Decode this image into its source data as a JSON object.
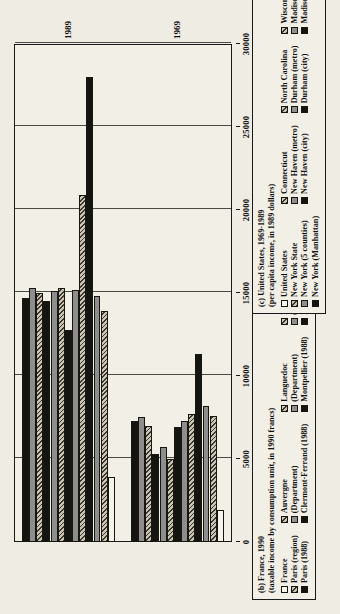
{
  "figure": {
    "axis": {
      "ticks": [
        "0",
        "5000",
        "10000",
        "15000",
        "20000",
        "25000",
        "30000"
      ],
      "tick_values": [
        0,
        5000,
        10000,
        15000,
        20000,
        25000,
        30000
      ],
      "max": 30000,
      "group_labels": [
        "1969",
        "1989"
      ]
    },
    "legend_b": {
      "title_line1": "(b) France, 1990",
      "title_line2": "(taxable income by consumption unit, in 1990 francs)",
      "columns": [
        {
          "header": "",
          "entries": [
            {
              "label": "France",
              "pattern": "white"
            },
            {
              "label": "Paris (region)",
              "pattern": "hatch"
            },
            {
              "label": "Paris (1988)",
              "pattern": "black"
            }
          ]
        },
        {
          "header": "Auvergne",
          "entries": [
            {
              "label": "Auvergne",
              "pattern": "hatch"
            },
            {
              "label": "(Department)",
              "pattern": "gray"
            },
            {
              "label": "Clermont-Ferrand (1988)",
              "pattern": "black"
            }
          ]
        },
        {
          "header": "Languedoc",
          "entries": [
            {
              "label": "Languedoc",
              "pattern": "hatch"
            },
            {
              "label": "(Department)",
              "pattern": "gray"
            },
            {
              "label": "Montpellier (1988)",
              "pattern": "black"
            }
          ]
        },
        {
          "header": "Lorraine",
          "entries": [
            {
              "label": "Lorraine",
              "pattern": "hatch"
            },
            {
              "label": "(Department)",
              "pattern": "gray"
            },
            {
              "label": "Nancy (1988)",
              "pattern": "black"
            }
          ]
        },
        {
          "header": "Brittany",
          "entries": [
            {
              "label": "Brittany",
              "pattern": "hatch"
            },
            {
              "label": "(Department)",
              "pattern": "gray"
            },
            {
              "label": "Rennes (1988)",
              "pattern": "black"
            }
          ]
        }
      ]
    },
    "legend_c": {
      "title_line1": "(c) United States, 1969-1989",
      "title_line2": "(per capita income, in 1989 dollars)",
      "columns": [
        {
          "entries": [
            {
              "label": "United States",
              "pattern": "white"
            },
            {
              "label": "New York State",
              "pattern": "hatch"
            },
            {
              "label": "New York (5 counties)",
              "pattern": "gray"
            },
            {
              "label": "New York (Manhattan)",
              "pattern": "black"
            }
          ]
        },
        {
          "entries": [
            {
              "label": "Connecticut",
              "pattern": "hatch"
            },
            {
              "label": "New Haven (metro)",
              "pattern": "gray"
            },
            {
              "label": "New Haven (city)",
              "pattern": "black"
            }
          ]
        },
        {
          "entries": [
            {
              "label": "North Carolina",
              "pattern": "hatch"
            },
            {
              "label": "Durham (metro)",
              "pattern": "gray"
            },
            {
              "label": "Durham (city)",
              "pattern": "black"
            }
          ]
        },
        {
          "entries": [
            {
              "label": "Wisconsin",
              "pattern": "hatch"
            },
            {
              "label": "Madison (metro)",
              "pattern": "gray"
            },
            {
              "label": "Madison (city)",
              "pattern": "black"
            }
          ]
        }
      ]
    }
  },
  "chart_data": {
    "type": "bar",
    "title": "",
    "xlabel": "",
    "ylabel": "",
    "ylim": [
      0,
      30000
    ],
    "orientation": "vertical-groups",
    "categories": [
      "1969",
      "1989"
    ],
    "series": [
      {
        "name": "United States / France",
        "pattern": "white",
        "values": [
          1900,
          3900
        ]
      },
      {
        "name": "New York State",
        "pattern": "hatch",
        "values": [
          7600,
          13900
        ]
      },
      {
        "name": "New York (5 counties)",
        "pattern": "gray",
        "values": [
          8200,
          14800
        ]
      },
      {
        "name": "New York (Manhattan)",
        "pattern": "black",
        "values": [
          11300,
          28000
        ]
      },
      {
        "name": "Connecticut",
        "pattern": "hatch",
        "values": [
          7700,
          20900
        ]
      },
      {
        "name": "New Haven (metro)",
        "pattern": "gray",
        "values": [
          7300,
          15200
        ]
      },
      {
        "name": "New Haven (city)",
        "pattern": "black",
        "values": [
          6900,
          12800
        ]
      },
      {
        "name": "North Carolina",
        "pattern": "hatch",
        "values": [
          5000,
          15300
        ]
      },
      {
        "name": "Durham (metro)",
        "pattern": "gray",
        "values": [
          5700,
          15100
        ]
      },
      {
        "name": "Durham (city)",
        "pattern": "black",
        "values": [
          5300,
          14500
        ]
      },
      {
        "name": "Wisconsin",
        "pattern": "hatch",
        "values": [
          7000,
          15000
        ]
      },
      {
        "name": "Madison (metro)",
        "pattern": "gray",
        "values": [
          7500,
          15300
        ]
      },
      {
        "name": "Madison (city)",
        "pattern": "black",
        "values": [
          7300,
          14700
        ]
      }
    ],
    "bars": [
      {
        "group": "1969",
        "series": "United States / France",
        "pattern": "white",
        "value": 1900
      },
      {
        "group": "1969",
        "series": "New York State",
        "pattern": "hatch",
        "value": 7600
      },
      {
        "group": "1969",
        "series": "New York (5 counties)",
        "pattern": "gray",
        "value": 8200
      },
      {
        "group": "1969",
        "series": "New York (Manhattan)",
        "pattern": "black",
        "value": 11300
      },
      {
        "group": "1969",
        "series": "Connecticut",
        "pattern": "hatch",
        "value": 7700
      },
      {
        "group": "1969",
        "series": "New Haven (metro)",
        "pattern": "gray",
        "value": 7300
      },
      {
        "group": "1969",
        "series": "New Haven (city)",
        "pattern": "black",
        "value": 6900
      },
      {
        "group": "1969",
        "series": "North Carolina",
        "pattern": "hatch",
        "value": 5000
      },
      {
        "group": "1969",
        "series": "Durham (metro)",
        "pattern": "gray",
        "value": 5700
      },
      {
        "group": "1969",
        "series": "Durham (city)",
        "pattern": "black",
        "value": 5300
      },
      {
        "group": "1969",
        "series": "Wisconsin",
        "pattern": "hatch",
        "value": 7000
      },
      {
        "group": "1969",
        "series": "Madison (metro)",
        "pattern": "gray",
        "value": 7500
      },
      {
        "group": "1969",
        "series": "Madison (city)",
        "pattern": "black",
        "value": 7300
      },
      {
        "group": "1989",
        "series": "United States / France",
        "pattern": "white",
        "value": 3900
      },
      {
        "group": "1989",
        "series": "New York State",
        "pattern": "hatch",
        "value": 13900
      },
      {
        "group": "1989",
        "series": "New York (5 counties)",
        "pattern": "gray",
        "value": 14800
      },
      {
        "group": "1989",
        "series": "New York (Manhattan)",
        "pattern": "black",
        "value": 28000
      },
      {
        "group": "1989",
        "series": "Connecticut",
        "pattern": "hatch",
        "value": 20900
      },
      {
        "group": "1989",
        "series": "New Haven (metro)",
        "pattern": "gray",
        "value": 15200
      },
      {
        "group": "1989",
        "series": "New Haven (city)",
        "pattern": "black",
        "value": 12800
      },
      {
        "group": "1989",
        "series": "North Carolina",
        "pattern": "hatch",
        "value": 15300
      },
      {
        "group": "1989",
        "series": "Durham (metro)",
        "pattern": "gray",
        "value": 15100
      },
      {
        "group": "1989",
        "series": "Durham (city)",
        "pattern": "black",
        "value": 14500
      },
      {
        "group": "1989",
        "series": "Wisconsin",
        "pattern": "hatch",
        "value": 15000
      },
      {
        "group": "1989",
        "series": "Madison (metro)",
        "pattern": "gray",
        "value": 15300
      },
      {
        "group": "1989",
        "series": "Madison (city)",
        "pattern": "black",
        "value": 14700
      }
    ]
  }
}
